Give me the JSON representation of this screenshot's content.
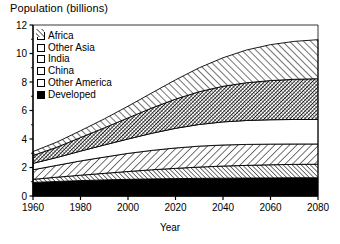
{
  "chart_data": {
    "type": "area",
    "title": "Population (billions)",
    "xlabel": "Year",
    "ylabel": "Population (billions)",
    "xlim": [
      1960,
      2080
    ],
    "ylim": [
      0,
      12
    ],
    "xticks": [
      1960,
      1980,
      2000,
      2020,
      2040,
      2060,
      2080
    ],
    "yticks": [
      0,
      2,
      4,
      6,
      8,
      10,
      12
    ],
    "grid": false,
    "stacked": true,
    "legend_position": "top-left inside axes",
    "x": [
      1960,
      1970,
      1980,
      1990,
      2000,
      2010,
      2020,
      2030,
      2040,
      2050,
      2060,
      2070,
      2080
    ],
    "series": [
      {
        "name": "Developed",
        "pattern": "solid-black",
        "values": [
          0.95,
          1.02,
          1.08,
          1.13,
          1.17,
          1.2,
          1.22,
          1.24,
          1.25,
          1.26,
          1.27,
          1.28,
          1.28
        ]
      },
      {
        "name": "Other America",
        "pattern": "diagonal-hatch-dense",
        "values": [
          0.22,
          0.3,
          0.38,
          0.46,
          0.55,
          0.64,
          0.72,
          0.79,
          0.85,
          0.89,
          0.92,
          0.94,
          0.95
        ]
      },
      {
        "name": "China",
        "pattern": "diagonal-line-backslash",
        "values": [
          0.67,
          0.83,
          1.0,
          1.14,
          1.27,
          1.36,
          1.43,
          1.47,
          1.48,
          1.47,
          1.45,
          1.43,
          1.42
        ]
      },
      {
        "name": "India",
        "pattern": "blank-white",
        "values": [
          0.45,
          0.55,
          0.69,
          0.85,
          1.01,
          1.2,
          1.38,
          1.52,
          1.62,
          1.68,
          1.71,
          1.72,
          1.72
        ]
      },
      {
        "name": "Other Asia",
        "pattern": "cross-hatch-dark",
        "values": [
          0.55,
          0.72,
          0.95,
          1.2,
          1.48,
          1.77,
          2.05,
          2.3,
          2.5,
          2.65,
          2.75,
          2.82,
          2.86
        ]
      },
      {
        "name": "Africa",
        "pattern": "diagonal-hatch-slash",
        "values": [
          0.28,
          0.36,
          0.48,
          0.63,
          0.82,
          1.06,
          1.35,
          1.68,
          2.0,
          2.3,
          2.52,
          2.66,
          2.74
        ]
      }
    ],
    "totals": [
      3.12,
      3.78,
      4.58,
      5.41,
      6.3,
      7.23,
      8.15,
      9.0,
      9.7,
      10.25,
      10.62,
      10.85,
      10.97
    ],
    "legend": [
      {
        "label": "Africa",
        "swatch": "diagonal-hatch-slash"
      },
      {
        "label": "Other Asia",
        "swatch": "cross-hatch-dark"
      },
      {
        "label": "India",
        "swatch": "blank-white"
      },
      {
        "label": "China",
        "swatch": "diagonal-line-backslash"
      },
      {
        "label": "Other America",
        "swatch": "diagonal-hatch-slash"
      },
      {
        "label": "Developed",
        "swatch": "solid-black"
      }
    ],
    "colors": {
      "line": "#000000",
      "background": "#ffffff",
      "fill_black": "#000000"
    }
  }
}
